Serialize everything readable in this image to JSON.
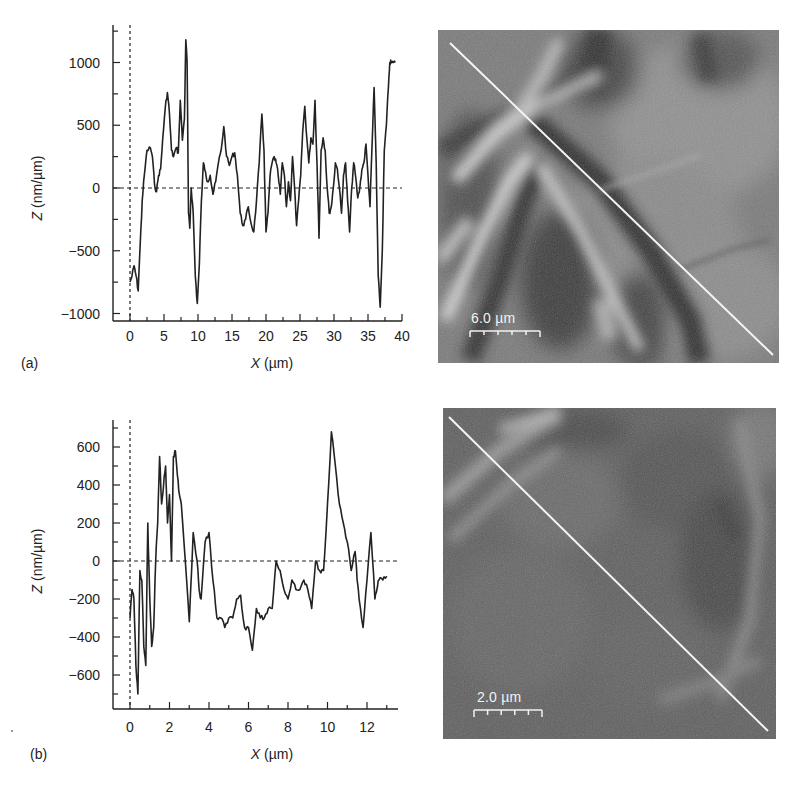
{
  "figure": {
    "panels": [
      {
        "id": "a",
        "label": "(a)",
        "image": {
          "scale_bar_label": "6.0 µm",
          "description": "AFM surface image with diagonal white profile line"
        }
      },
      {
        "id": "b",
        "label": "(b)",
        "image": {
          "scale_bar_label": "2.0 µm",
          "description": "AFM surface image with diagonal white profile line"
        }
      }
    ]
  },
  "chart_data": [
    {
      "type": "line",
      "panel": "(a)",
      "title": "",
      "xlabel": "X (µm)",
      "ylabel": "Z (nm/µm)",
      "xlim": [
        -1.5,
        40
      ],
      "ylim": [
        -1050,
        1300
      ],
      "xticks": [
        0,
        5,
        10,
        15,
        20,
        25,
        30,
        35,
        40
      ],
      "yticks": [
        -1000,
        -500,
        0,
        500,
        1000
      ],
      "reference_lines": {
        "y0_dashed": true,
        "x0_dashed": true
      },
      "grid": false,
      "legend": null,
      "series": [
        {
          "name": "profile",
          "x": [
            0,
            0.3,
            0.6,
            0.9,
            1.2,
            1.5,
            1.8,
            2.1,
            2.5,
            3.0,
            3.3,
            3.6,
            3.9,
            4.2,
            4.5,
            4.8,
            5.2,
            5.5,
            5.8,
            6.1,
            6.4,
            6.8,
            7.1,
            7.4,
            7.7,
            8.0,
            8.2,
            8.4,
            8.6,
            8.8,
            9.0,
            9.3,
            9.6,
            9.9,
            10.2,
            10.5,
            10.8,
            11.1,
            11.4,
            11.8,
            12.2,
            12.6,
            13.0,
            13.4,
            13.8,
            14.2,
            14.6,
            15.0,
            15.4,
            15.8,
            16.2,
            16.6,
            17.0,
            17.4,
            17.8,
            18.2,
            18.6,
            19.0,
            19.4,
            19.7,
            20.0,
            20.3,
            20.6,
            20.9,
            21.2,
            21.5,
            21.8,
            22.1,
            22.4,
            22.7,
            23.0,
            23.3,
            23.6,
            23.9,
            24.2,
            24.5,
            24.8,
            25.1,
            25.4,
            25.7,
            26.0,
            26.3,
            26.6,
            26.9,
            27.2,
            27.5,
            27.8,
            28.1,
            28.4,
            28.7,
            29.0,
            29.3,
            29.6,
            29.9,
            30.2,
            30.5,
            30.8,
            31.1,
            31.4,
            31.7,
            32.0,
            32.3,
            32.6,
            32.9,
            33.2,
            33.5,
            33.8,
            34.1,
            34.4,
            34.7,
            35.0,
            35.3,
            35.6,
            35.9,
            36.2,
            36.5,
            36.8,
            37.1,
            37.4,
            37.7,
            38.0,
            38.2,
            38.4,
            38.7,
            39.0,
            39.3,
            39.6
          ],
          "values": [
            -750,
            -700,
            -620,
            -700,
            -820,
            -450,
            -100,
            100,
            300,
            320,
            250,
            30,
            -30,
            100,
            150,
            380,
            650,
            760,
            600,
            300,
            250,
            320,
            280,
            700,
            380,
            550,
            1180,
            1000,
            -200,
            -320,
            0,
            -200,
            -700,
            -920,
            -600,
            -100,
            200,
            130,
            50,
            100,
            -50,
            50,
            200,
            300,
            490,
            250,
            180,
            250,
            280,
            100,
            -200,
            -300,
            -250,
            -150,
            -280,
            -350,
            -100,
            200,
            590,
            300,
            -350,
            -200,
            100,
            200,
            250,
            200,
            100,
            -50,
            200,
            100,
            -150,
            50,
            -100,
            250,
            0,
            -300,
            -100,
            100,
            450,
            650,
            400,
            200,
            400,
            350,
            700,
            200,
            -400,
            300,
            400,
            300,
            0,
            -200,
            -150,
            0,
            200,
            150,
            0,
            -200,
            100,
            200,
            -100,
            -350,
            0,
            200,
            80,
            -80,
            0,
            150,
            200,
            350,
            100,
            -150,
            350,
            800,
            200,
            -700,
            -950,
            -500,
            300,
            500,
            800,
            1000,
            1000,
            1000,
            1000
          ]
        }
      ]
    },
    {
      "type": "line",
      "panel": "(b)",
      "title": "",
      "xlabel": "X (µm)",
      "ylabel": "Z (nm/µm)",
      "xlim": [
        -0.85,
        13.5
      ],
      "ylim": [
        -780,
        730
      ],
      "xticks": [
        0,
        2,
        4,
        6,
        8,
        10,
        12
      ],
      "yticks": [
        -600,
        -400,
        -200,
        0,
        200,
        400,
        600
      ],
      "reference_lines": {
        "y0_dashed": true,
        "x0_dashed": true
      },
      "grid": false,
      "legend": null,
      "series": [
        {
          "name": "profile",
          "x": [
            0,
            0.1,
            0.2,
            0.3,
            0.4,
            0.5,
            0.6,
            0.7,
            0.8,
            0.9,
            1.0,
            1.1,
            1.2,
            1.3,
            1.4,
            1.5,
            1.6,
            1.7,
            1.8,
            1.9,
            2.0,
            2.1,
            2.2,
            2.3,
            2.4,
            2.5,
            2.6,
            2.8,
            3.0,
            3.2,
            3.4,
            3.5,
            3.6,
            3.8,
            4.0,
            4.2,
            4.4,
            4.6,
            4.8,
            5.0,
            5.2,
            5.4,
            5.6,
            5.8,
            6.0,
            6.2,
            6.4,
            6.6,
            6.8,
            7.0,
            7.2,
            7.4,
            7.6,
            7.8,
            8.0,
            8.2,
            8.4,
            8.6,
            8.8,
            9.0,
            9.2,
            9.4,
            9.6,
            9.8,
            10.0,
            10.2,
            10.4,
            10.6,
            10.8,
            11.0,
            11.2,
            11.4,
            11.5,
            11.6,
            11.8,
            12.0,
            12.2,
            12.4,
            12.5,
            12.6,
            12.8,
            13.0,
            13.2
          ],
          "values": [
            -300,
            -150,
            -200,
            -550,
            -700,
            -50,
            -100,
            -450,
            -550,
            200,
            -200,
            -450,
            -350,
            0,
            200,
            550,
            300,
            400,
            500,
            200,
            350,
            0,
            550,
            580,
            450,
            350,
            300,
            0,
            -320,
            150,
            0,
            -150,
            -200,
            100,
            150,
            -100,
            -300,
            -300,
            -350,
            -300,
            -300,
            -200,
            -180,
            -350,
            -350,
            -470,
            -250,
            -300,
            -300,
            -250,
            -250,
            0,
            -50,
            -150,
            -200,
            -100,
            -150,
            -150,
            -100,
            -150,
            -250,
            0,
            -50,
            -50,
            300,
            680,
            500,
            300,
            200,
            100,
            -50,
            50,
            -100,
            -200,
            -350,
            -100,
            150,
            -200,
            -150,
            -100,
            -100,
            -80
          ]
        }
      ]
    }
  ]
}
